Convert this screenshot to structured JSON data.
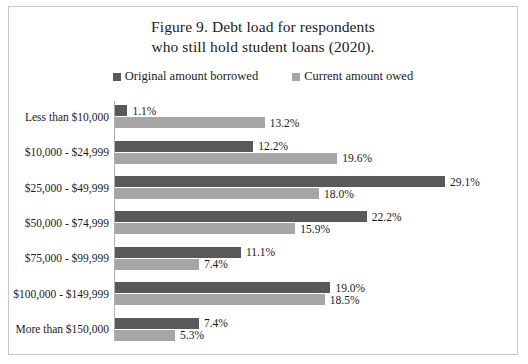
{
  "figure": {
    "title_line1": "Figure 9. Debt load for respondents",
    "title_line2": "who still hold student loans (2020)."
  },
  "legend": {
    "items": [
      {
        "label": "Original amount borrowed",
        "color": "#595959",
        "swatch_name": "legend-swatch-original"
      },
      {
        "label": "Current amount owed",
        "color": "#a6a6a6",
        "swatch_name": "legend-swatch-current"
      }
    ]
  },
  "chart_data": {
    "type": "bar",
    "orientation": "horizontal",
    "title": "Figure 9. Debt load for respondents who still hold student loans (2020).",
    "xlabel": "",
    "ylabel": "",
    "xlim": [
      0,
      29.1
    ],
    "grid": false,
    "legend_position": "top-center",
    "value_suffix": "%",
    "categories": [
      "Less than $10,000",
      "$10,000 - $24,999",
      "$25,000 - $49,999",
      "$50,000 - $74,999",
      "$75,000 - $99,999",
      "$100,000 - $149,999",
      "More than $150,000"
    ],
    "series": [
      {
        "name": "Original amount borrowed",
        "color": "#595959",
        "values": [
          1.1,
          12.2,
          29.1,
          22.2,
          11.1,
          19.0,
          7.4
        ],
        "labels": [
          "1.1%",
          "12.2%",
          "29.1%",
          "22.2%",
          "11.1%",
          "19.0%",
          "7.4%"
        ]
      },
      {
        "name": "Current amount owed",
        "color": "#a6a6a6",
        "values": [
          13.2,
          19.6,
          18.0,
          15.9,
          7.4,
          18.5,
          5.3
        ],
        "labels": [
          "13.2%",
          "19.6%",
          "18.0%",
          "15.9%",
          "7.4%",
          "18.5%",
          "5.3%"
        ]
      }
    ]
  },
  "style": {
    "background": "#ffffff",
    "border_color": "#c8c8c8",
    "axis_color": "#b0b0b0",
    "text_color": "#1a1a1a"
  }
}
